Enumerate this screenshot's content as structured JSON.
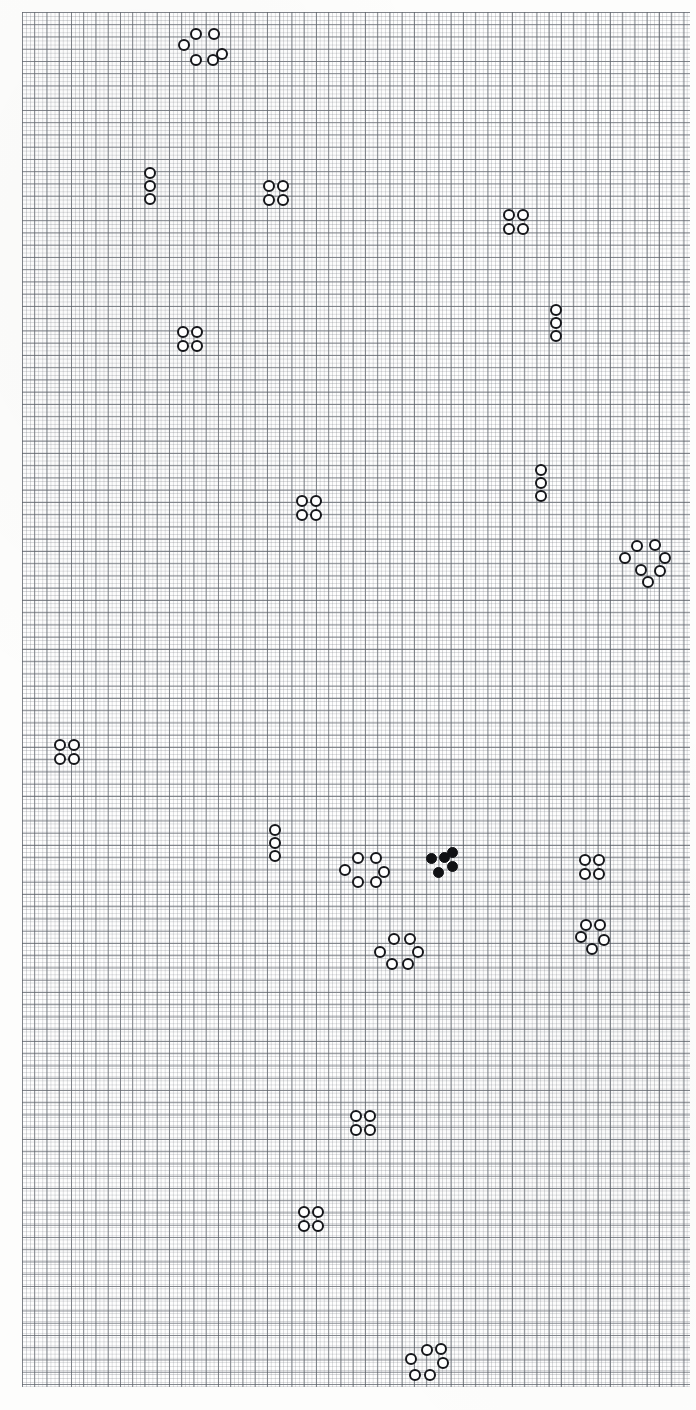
{
  "figure": {
    "background_color": "#fdfdfc",
    "grid": {
      "minor_spacing_px": 4.08,
      "major_spacing_px": 12.25,
      "minor_color": "#787c82",
      "major_color": "#4e545c",
      "left_px": 22,
      "top_px": 12,
      "width_px": 668,
      "height_px": 1375,
      "grid_on": true
    },
    "marker": {
      "open_fill": "#ffffff",
      "open_stroke": "#15161a",
      "filled_color": "#101114",
      "diameter_px": 12,
      "stroke_px": 2.4
    }
  },
  "chart_data": {
    "type": "scatter",
    "subtitle": "",
    "xlabel": "",
    "ylabel": "",
    "xlim": [
      0,
      696
    ],
    "ylim": [
      0,
      1410
    ],
    "grid": true,
    "legend": null,
    "annotations": [],
    "units": "pixels",
    "y_axis_direction": "top-down",
    "summary": {
      "cluster_count": 21,
      "total_markers": 88,
      "open_markers": 83,
      "filled_markers": 5,
      "shapes_present": [
        "square-4",
        "vertical-3",
        "ring-6",
        "ring-7",
        "ring-5",
        "arc-6",
        "plus-5"
      ]
    },
    "series": [
      {
        "name": "open circles",
        "marker": "open-circle",
        "color": "#15161a",
        "fill": "#ffffff",
        "count": 83
      },
      {
        "name": "filled circles",
        "marker": "filled-circle",
        "color": "#101114",
        "fill": "#101114",
        "count": 5
      }
    ],
    "clusters": [
      {
        "id": "c01",
        "shape": "ring-6",
        "style": "open",
        "center": [
          205,
          47
        ],
        "points": [
          [
            196,
            34
          ],
          [
            214,
            34
          ],
          [
            184,
            45
          ],
          [
            222,
            54
          ],
          [
            196,
            60
          ],
          [
            213,
            60
          ]
        ]
      },
      {
        "id": "c02",
        "shape": "vertical-3",
        "style": "open",
        "center": [
          150,
          186
        ],
        "points": [
          [
            150,
            173
          ],
          [
            150,
            186
          ],
          [
            150,
            199
          ]
        ]
      },
      {
        "id": "c03",
        "shape": "square-4",
        "style": "open",
        "center": [
          276,
          193
        ],
        "points": [
          [
            269,
            186
          ],
          [
            283,
            186
          ],
          [
            269,
            200
          ],
          [
            283,
            200
          ]
        ]
      },
      {
        "id": "c04",
        "shape": "square-4",
        "style": "open",
        "center": [
          516,
          222
        ],
        "points": [
          [
            509,
            215
          ],
          [
            523,
            215
          ],
          [
            509,
            229
          ],
          [
            523,
            229
          ]
        ]
      },
      {
        "id": "c05",
        "shape": "vertical-3",
        "style": "open",
        "center": [
          556,
          323
        ],
        "points": [
          [
            556,
            310
          ],
          [
            556,
            323
          ],
          [
            556,
            336
          ]
        ]
      },
      {
        "id": "c06",
        "shape": "square-4",
        "style": "open",
        "center": [
          190,
          339
        ],
        "points": [
          [
            183,
            332
          ],
          [
            197,
            332
          ],
          [
            183,
            346
          ],
          [
            197,
            346
          ]
        ]
      },
      {
        "id": "c07",
        "shape": "vertical-3",
        "style": "open",
        "center": [
          541,
          483
        ],
        "points": [
          [
            541,
            470
          ],
          [
            541,
            483
          ],
          [
            541,
            496
          ]
        ]
      },
      {
        "id": "c08",
        "shape": "square-4",
        "style": "open",
        "center": [
          309,
          508
        ],
        "points": [
          [
            302,
            501
          ],
          [
            316,
            501
          ],
          [
            302,
            515
          ],
          [
            316,
            515
          ]
        ]
      },
      {
        "id": "c09",
        "shape": "ring-7",
        "style": "open",
        "center": [
          645,
          559
        ],
        "points": [
          [
            637,
            546
          ],
          [
            655,
            545
          ],
          [
            625,
            558
          ],
          [
            665,
            558
          ],
          [
            641,
            570
          ],
          [
            660,
            571
          ],
          [
            648,
            582
          ]
        ]
      },
      {
        "id": "c10",
        "shape": "square-4",
        "style": "open",
        "center": [
          67,
          752
        ],
        "points": [
          [
            60,
            745
          ],
          [
            74,
            745
          ],
          [
            60,
            759
          ],
          [
            74,
            759
          ]
        ]
      },
      {
        "id": "c11",
        "shape": "vertical-3",
        "style": "open",
        "center": [
          275,
          843
        ],
        "points": [
          [
            275,
            830
          ],
          [
            275,
            843
          ],
          [
            275,
            856
          ]
        ]
      },
      {
        "id": "c12",
        "shape": "ring-6",
        "style": "open",
        "center": [
          365,
          869
        ],
        "points": [
          [
            358,
            858
          ],
          [
            376,
            858
          ],
          [
            345,
            870
          ],
          [
            384,
            872
          ],
          [
            358,
            882
          ],
          [
            376,
            882
          ]
        ]
      },
      {
        "id": "c13",
        "shape": "plus-5",
        "style": "filled",
        "center": [
          437,
          864
        ],
        "points": [
          [
            431,
            858
          ],
          [
            444,
            857
          ],
          [
            452,
            852
          ],
          [
            452,
            866
          ],
          [
            438,
            872
          ]
        ]
      },
      {
        "id": "c14",
        "shape": "square-4",
        "style": "open",
        "center": [
          592,
          867
        ],
        "points": [
          [
            585,
            860
          ],
          [
            599,
            860
          ],
          [
            585,
            874
          ],
          [
            599,
            874
          ]
        ]
      },
      {
        "id": "c15",
        "shape": "ring-5",
        "style": "open",
        "center": [
          592,
          937
        ],
        "points": [
          [
            586,
            925
          ],
          [
            600,
            925
          ],
          [
            581,
            937
          ],
          [
            604,
            940
          ],
          [
            592,
            949
          ]
        ]
      },
      {
        "id": "c16",
        "shape": "ring-6",
        "style": "open",
        "center": [
          400,
          950
        ],
        "points": [
          [
            394,
            939
          ],
          [
            410,
            939
          ],
          [
            380,
            952
          ],
          [
            418,
            952
          ],
          [
            392,
            964
          ],
          [
            408,
            964
          ]
        ]
      },
      {
        "id": "c17",
        "shape": "square-4",
        "style": "open",
        "center": [
          363,
          1123
        ],
        "points": [
          [
            356,
            1116
          ],
          [
            370,
            1116
          ],
          [
            356,
            1130
          ],
          [
            370,
            1130
          ]
        ]
      },
      {
        "id": "c18",
        "shape": "square-4",
        "style": "open",
        "center": [
          311,
          1219
        ],
        "points": [
          [
            304,
            1212
          ],
          [
            318,
            1212
          ],
          [
            304,
            1226
          ],
          [
            318,
            1226
          ]
        ]
      },
      {
        "id": "c19",
        "shape": "arc-6",
        "style": "open",
        "center": [
          430,
          1366
        ],
        "points": [
          [
            427,
            1350
          ],
          [
            441,
            1349
          ],
          [
            411,
            1359
          ],
          [
            443,
            1363
          ],
          [
            415,
            1375
          ],
          [
            430,
            1375
          ]
        ]
      }
    ]
  }
}
